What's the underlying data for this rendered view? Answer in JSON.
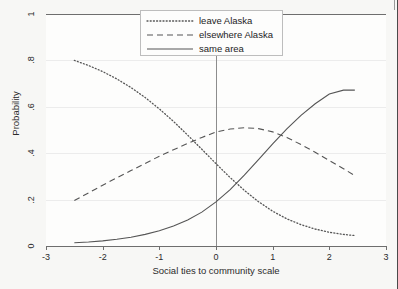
{
  "chart_data": {
    "type": "line",
    "title": "",
    "subtitle": "",
    "xlabel": "Social ties to community scale",
    "ylabel": "Probability",
    "xlim": [
      -3,
      3
    ],
    "ylim": [
      0,
      1
    ],
    "xticks": [
      "-3",
      "-2",
      "-1",
      "0",
      "1",
      "2",
      "3"
    ],
    "xtick_values": [
      -3,
      -2,
      -1,
      0,
      1,
      2,
      3
    ],
    "yticks": [
      "0",
      ".2",
      ".4",
      ".6",
      ".8",
      "1"
    ],
    "ytick_values": [
      0,
      0.2,
      0.4,
      0.6,
      0.8,
      1
    ],
    "grid": "horizontal",
    "legend_position": "top-center",
    "reference_line_x": 0,
    "x": [
      -2.5,
      -2.25,
      -2.0,
      -1.75,
      -1.5,
      -1.25,
      -1.0,
      -0.75,
      -0.5,
      -0.25,
      0.0,
      0.25,
      0.5,
      0.75,
      1.0,
      1.25,
      1.5,
      1.75,
      2.0,
      2.25,
      2.45
    ],
    "series": [
      {
        "name": "leave Alaska",
        "style": "dotted",
        "color": "#555555",
        "values": [
          0.8,
          0.778,
          0.752,
          0.72,
          0.683,
          0.64,
          0.591,
          0.537,
          0.478,
          0.417,
          0.355,
          0.295,
          0.24,
          0.191,
          0.15,
          0.117,
          0.092,
          0.073,
          0.059,
          0.05,
          0.045
        ]
      },
      {
        "name": "elsewhere Alaska",
        "style": "dashed",
        "color": "#555555",
        "values": [
          0.196,
          0.229,
          0.262,
          0.294,
          0.325,
          0.356,
          0.387,
          0.415,
          0.442,
          0.468,
          0.491,
          0.504,
          0.51,
          0.506,
          0.492,
          0.468,
          0.437,
          0.404,
          0.368,
          0.333,
          0.303
        ]
      },
      {
        "name": "same area",
        "style": "solid",
        "color": "#555555",
        "values": [
          0.014,
          0.017,
          0.022,
          0.029,
          0.038,
          0.05,
          0.066,
          0.086,
          0.112,
          0.146,
          0.19,
          0.243,
          0.305,
          0.372,
          0.44,
          0.505,
          0.563,
          0.613,
          0.655,
          0.672,
          0.672
        ]
      }
    ]
  },
  "axes": {
    "ylabel": "Probability",
    "xlabel": "Social ties to community scale",
    "ytick_labels": [
      "0",
      ".2",
      ".4",
      ".6",
      ".8",
      "1"
    ],
    "xtick_labels": [
      "-3",
      "-2",
      "-1",
      "0",
      "1",
      "2",
      "3"
    ]
  },
  "legend": {
    "items": [
      {
        "label": "leave Alaska",
        "style": "dotted"
      },
      {
        "label": "elsewhere Alaska",
        "style": "dashed"
      },
      {
        "label": "same area",
        "style": "solid"
      }
    ]
  }
}
